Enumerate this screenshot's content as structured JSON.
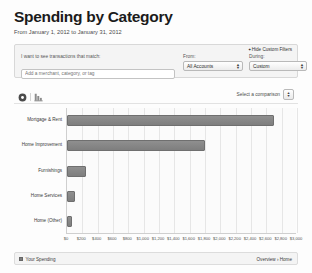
{
  "header": {
    "title": "Spending by Category",
    "date_range": "From January 1, 2012 to January 31, 2012"
  },
  "filters": {
    "hide_custom_filters_label": "Hide Custom Filters",
    "hide_caret": "✦",
    "match_label": "I want to see transactions that match:",
    "match_placeholder": "Add a merchant, category, or tag",
    "match_value": "",
    "from_label": "From:",
    "from_value": "All Accounts",
    "during_label": "During:",
    "during_value": "Custom"
  },
  "comparison": {
    "pie_icon": "pie-chart-icon",
    "bar_icon": "bar-chart-icon",
    "select_label": "Select a comparison"
  },
  "chart_data": {
    "type": "bar",
    "orientation": "horizontal",
    "title": "Spending by Category",
    "xlabel": "",
    "ylabel": "",
    "xlim": [
      0,
      3000
    ],
    "grid": true,
    "legend_position": "bottom-left",
    "categories": [
      "Mortgage & Rent",
      "Home Improvement",
      "Furnishings",
      "Home Services",
      "Home (Other)"
    ],
    "values": [
      2700,
      1800,
      250,
      110,
      60
    ],
    "series": [
      {
        "name": "Your Spending",
        "values": [
          2700,
          1800,
          250,
          110,
          60
        ],
        "color": "#7e7e7e"
      }
    ],
    "xticks": [
      0,
      200,
      400,
      600,
      800,
      1000,
      1200,
      1400,
      1600,
      1800,
      2000,
      2200,
      2400,
      2600,
      2800,
      3000
    ],
    "xticklabels": [
      "$0",
      "$200",
      "$400",
      "$600",
      "$800",
      "$1,000",
      "$1,200",
      "$1,400",
      "$1,600",
      "$1,800",
      "$2,000",
      "$2,200",
      "$2,400",
      "$2,600",
      "$2,800",
      "$3,000"
    ]
  },
  "footer": {
    "legend_label": "Your Spending",
    "breadcrumb": "Overview › Home"
  }
}
